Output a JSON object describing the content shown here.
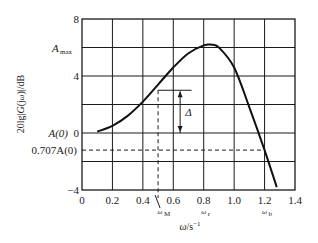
{
  "chart_data": {
    "type": "line",
    "title": "",
    "xlabel": "ω/s⁻¹",
    "ylabel": "20lg|G(jω)|/dB",
    "xlim": [
      0,
      1.4
    ],
    "ylim": [
      -4,
      8
    ],
    "grid": true,
    "x_ticks": [
      "0",
      "0.2",
      "0.4",
      "0.6",
      "0.8",
      "1.0",
      "1.2",
      "1.4"
    ],
    "y_ticks": [
      "8",
      "4",
      "0",
      "−4"
    ],
    "y_tick_values": [
      8,
      6,
      4,
      2,
      0,
      -2,
      -4
    ],
    "y_annotations": [
      {
        "label": "A",
        "sub": "max",
        "value": 6
      },
      {
        "label": "A(0)",
        "value": 0
      },
      {
        "label": "0.707A(0)",
        "value": -1.2
      }
    ],
    "x_annotations": [
      {
        "label": "ω",
        "sub": "M",
        "value": 0.5
      },
      {
        "label": "ω",
        "sub": "r",
        "value": 0.8
      },
      {
        "label": "ω",
        "sub": "b",
        "value": 1.2
      }
    ],
    "delta_label": "Δ",
    "series": [
      {
        "name": "20lg|G(jω)|",
        "x": [
          0.1,
          0.2,
          0.3,
          0.4,
          0.5,
          0.6,
          0.7,
          0.8,
          0.85,
          0.9,
          1.0,
          1.1,
          1.2,
          1.28
        ],
        "y": [
          0.1,
          0.5,
          1.2,
          2.2,
          3.4,
          4.6,
          5.6,
          6.15,
          6.2,
          6.0,
          4.6,
          1.8,
          -1.2,
          -3.8
        ]
      }
    ],
    "legend": null
  }
}
